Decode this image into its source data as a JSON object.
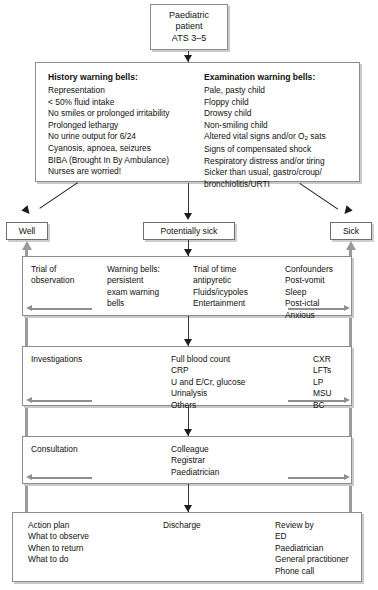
{
  "diagram": {
    "top_node": {
      "line1": "Paediatric",
      "line2": "patient",
      "line3": "ATS 3–5"
    },
    "warning_bells": {
      "history": {
        "title": "History warning bells:",
        "items": [
          "Representation",
          "< 50% fluid intake",
          "No smiles or prolonged irritability",
          "Prolonged lethargy",
          "No urine output for 6/24",
          "Cyanosis, apnoea, seizures",
          "BIBA (Brought In By Ambulance)",
          "Nurses are worried!"
        ]
      },
      "examination": {
        "title": "Examination warning bells:",
        "items": [
          "Pale, pasty child",
          "Floppy child",
          "Drowsy child",
          "Non-smiling child",
          "Altered vital signs and/or O2 sats",
          "Signs of compensated shock",
          "Respiratory distress and/or tiring",
          "Sicker than usual, gastro/croup/",
          "bronchiolitis/URTI"
        ]
      }
    },
    "triage_nodes": {
      "well": "Well",
      "potentially_sick": "Potentially sick",
      "sick": "Sick"
    },
    "stages": [
      {
        "name": "observation",
        "columns": [
          {
            "lines": [
              "Trial of",
              "observation"
            ]
          },
          {
            "lines": [
              "Warning bells:",
              "persistent",
              "exam warning",
              "bells"
            ]
          },
          {
            "lines": [
              "Trial of time",
              "antipyretic",
              "Fluids/icypoles",
              "Entertainment"
            ]
          },
          {
            "lines": [
              "Confounders",
              "Post-vomit",
              "Sleep",
              "Post-ictal",
              "Anxious"
            ]
          }
        ]
      },
      {
        "name": "investigations",
        "columns": [
          {
            "lines": [
              "Investigations"
            ]
          },
          {
            "lines": [
              "Full blood count",
              "CRP",
              "U and E/Cr, glucose",
              "Urinalysis",
              "Others"
            ]
          },
          {
            "lines": [
              "CXR",
              "LFTs",
              "LP",
              "MSU",
              "BC"
            ]
          }
        ]
      },
      {
        "name": "consultation",
        "columns": [
          {
            "lines": [
              "Consultation"
            ]
          },
          {
            "lines": [
              "Colleague",
              "Registrar",
              "Paediatrician"
            ]
          }
        ]
      }
    ],
    "final_stage": {
      "name": "action-plan",
      "columns": [
        {
          "lines": [
            "Action plan",
            "What to observe",
            "When to return",
            "What to do"
          ]
        },
        {
          "lines": [
            "Discharge"
          ]
        },
        {
          "lines": [
            "Review by",
            "ED",
            "Paediatrician",
            "General practitioner",
            "Phone call"
          ]
        }
      ]
    },
    "colors": {
      "box_border": "#8d8d8d",
      "box_shadow": "#c9c9c9",
      "connector": "#3a3a3a",
      "rail": "#9a9a9a",
      "text": "#111111",
      "background": "#ffffff"
    }
  }
}
